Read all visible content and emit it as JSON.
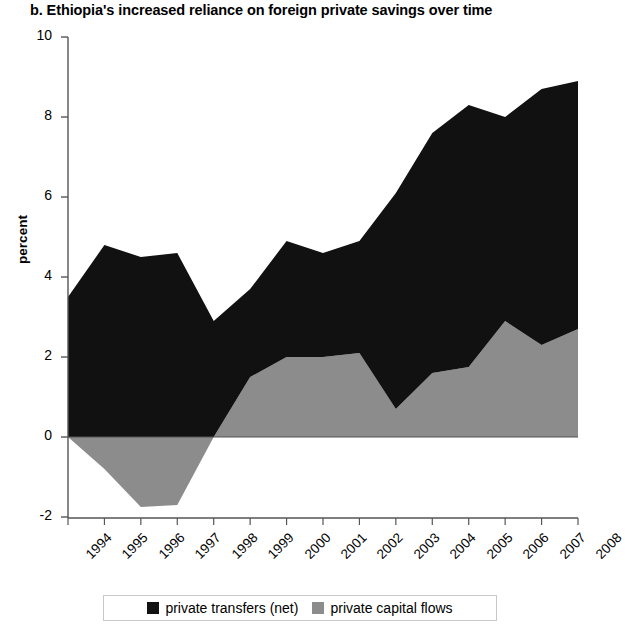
{
  "chart_data": {
    "type": "area",
    "title": "b. Ethiopia's increased reliance on foreign private savings over time",
    "xlabel": "",
    "ylabel": "percent",
    "stacked": true,
    "grid": false,
    "legend_position": "bottom",
    "categories": [
      "1994",
      "1995",
      "1996",
      "1997",
      "1998",
      "1999",
      "2000",
      "2001",
      "2002",
      "2003",
      "2004",
      "2005",
      "2006",
      "2007",
      "2008"
    ],
    "x": [
      1994,
      1995,
      1996,
      1997,
      1998,
      1999,
      2000,
      2001,
      2002,
      2003,
      2004,
      2005,
      2006,
      2007,
      2008
    ],
    "xlim": [
      1994,
      2008
    ],
    "ylim": [
      -2,
      10
    ],
    "yticks": [
      -2,
      0,
      2,
      4,
      6,
      8,
      10
    ],
    "ytick_labels": [
      "-2",
      "0",
      "2",
      "4",
      "6",
      "8",
      "10"
    ],
    "series": [
      {
        "name": "private capital flows",
        "color": "#8c8c8c",
        "values": [
          0.0,
          -0.8,
          -1.75,
          -1.7,
          0.0,
          1.5,
          2.0,
          2.0,
          2.1,
          0.7,
          1.6,
          1.75,
          2.9,
          2.3,
          2.7
        ]
      },
      {
        "name": "private transfers (net)",
        "color": "#111111",
        "values": [
          3.5,
          4.8,
          4.5,
          4.6,
          2.9,
          2.2,
          2.9,
          2.6,
          2.8,
          5.4,
          6.0,
          6.55,
          5.1,
          6.4,
          6.2
        ]
      }
    ],
    "series_totals": [
      {
        "name": "total (stacked top)",
        "values": [
          3.5,
          4.0,
          2.75,
          2.9,
          2.9,
          3.7,
          4.9,
          4.6,
          4.9,
          6.1,
          7.6,
          8.3,
          8.0,
          8.7,
          8.9
        ]
      }
    ],
    "legend": [
      {
        "label": "private transfers (net)",
        "color": "#111111",
        "icon": "square-swatch-black"
      },
      {
        "label": "private capital flows",
        "color": "#8c8c8c",
        "icon": "square-swatch-gray"
      }
    ]
  }
}
